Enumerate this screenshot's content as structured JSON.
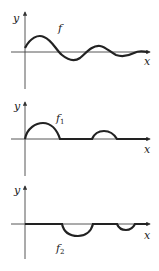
{
  "panels": [
    {
      "id": "f",
      "label": "f",
      "sub": "",
      "ylabel": "y",
      "xlabel": "x",
      "description": "damped oscillation"
    },
    {
      "id": "f1",
      "label": "f",
      "sub": "1",
      "ylabel": "y",
      "xlabel": "x",
      "description": "positive part of f"
    },
    {
      "id": "f2",
      "label": "f",
      "sub": "2",
      "ylabel": "y",
      "xlabel": "x",
      "description": "negative part of f"
    }
  ],
  "colors": {
    "curve": "#222222",
    "axis": "#444444"
  }
}
